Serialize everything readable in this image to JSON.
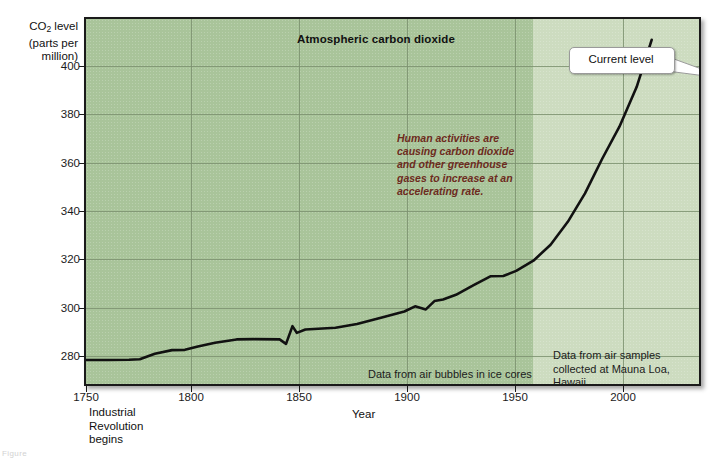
{
  "figure": {
    "bottom_caption": "Figure"
  },
  "chart_data": {
    "type": "line",
    "title": "Atmospheric carbon dioxide",
    "xlabel": "Year",
    "ylabel": "CO2 level",
    "ylabel_unit": "(parts per million)",
    "ylabel_prefix": "CO",
    "ylabel_sub": "2",
    "ylabel_suffix": " level",
    "xlim": [
      1750,
      2035
    ],
    "ylim": [
      268,
      408
    ],
    "grid": true,
    "legend_position": "none",
    "y_ticks": [
      400,
      380,
      360,
      340,
      320,
      300,
      280
    ],
    "x_ticks": [
      1750,
      1800,
      1850,
      1900,
      1950,
      2000
    ],
    "series_name": "Atmospheric CO2 concentration",
    "x": [
      1750,
      1760,
      1770,
      1775,
      1782,
      1790,
      1796,
      1802,
      1810,
      1820,
      1828,
      1840,
      1843,
      1846,
      1848,
      1852,
      1858,
      1866,
      1876,
      1888,
      1898,
      1903,
      1908,
      1912,
      1916,
      1922,
      1930,
      1938,
      1944,
      1950,
      1958,
      1966,
      1974,
      1982,
      1990,
      1998,
      2006,
      2013
    ],
    "y": [
      277.2,
      277.2,
      277.3,
      277.5,
      279.6,
      281.0,
      281.1,
      282.4,
      283.8,
      285.1,
      285.2,
      285.1,
      283.4,
      290.2,
      287.6,
      288.9,
      289.2,
      289.6,
      291.0,
      293.6,
      295.8,
      297.8,
      296.6,
      299.8,
      300.4,
      302.2,
      305.8,
      309.3,
      309.4,
      311.4,
      315.3,
      321.4,
      330.2,
      341.1,
      354.4,
      366.7,
      381.9,
      400.0
    ],
    "annotation": "Human activities are causing carbon dioxide and other greenhouse gases to increase at an accelerating rate.",
    "annotation_color": "#6d2b20",
    "callout_label": "Current level",
    "marker_label": "current-level-star",
    "marker_color": "#ee2211",
    "marker_year": 2013,
    "marker_value": 400,
    "region_label_left": "Data from air bubbles in ice cores",
    "region_label_right": "Data from air samples collected at Mauna Loa, Hawaii",
    "region_split_year": 1958,
    "axis_note": "Industrial Revolution begins",
    "axis_note_line1": "Industrial",
    "axis_note_line2": "Revolution",
    "axis_note_line3": "begins",
    "axis_note_year": 1775,
    "plot_bg_color": "#a9c49a",
    "plot_bg_color_light": "#cddcc0",
    "line_color": "#111111",
    "grid_color": "#7d9270"
  }
}
